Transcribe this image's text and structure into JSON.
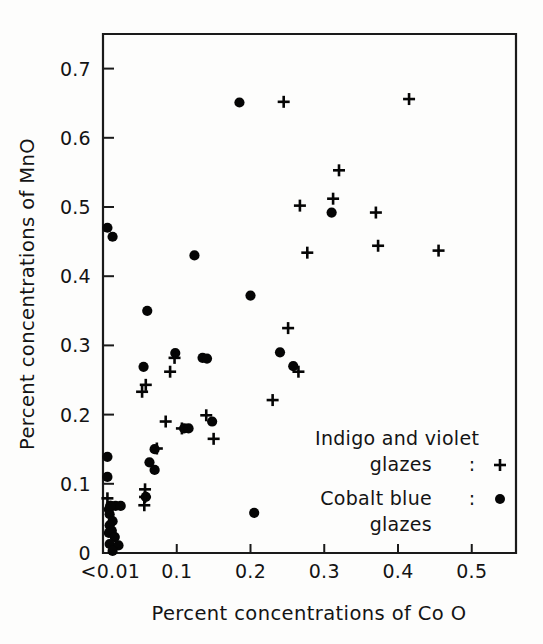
{
  "figure": {
    "background": "#fdfdfc",
    "ink_color": "#141414"
  },
  "axes": {
    "x_title": "Percent concentrations of Co O",
    "y_title": "Percent concentrations of MnO",
    "x_ticks": [
      "<0.01",
      "0.1",
      "0.2",
      "0.3",
      "0.4",
      "0.5"
    ],
    "x_tick_values": [
      0.01,
      0.1,
      0.2,
      0.3,
      0.4,
      0.5
    ],
    "y_ticks": [
      "0",
      "0.1",
      "0.2",
      "0.3",
      "0.4",
      "0.5",
      "0.6",
      "0.7"
    ],
    "y_tick_values": [
      0,
      0.1,
      0.2,
      0.3,
      0.4,
      0.5,
      0.6,
      0.7
    ]
  },
  "legend": {
    "entries": [
      {
        "line1": "Indigo and violet",
        "line2": "glazes",
        "separator": ":",
        "marker": "plus",
        "marker_glyph": "+"
      },
      {
        "line1": "Cobalt blue",
        "line2": "glazes",
        "separator": ":",
        "marker": "dot",
        "marker_glyph": "•"
      }
    ]
  },
  "chart_data": {
    "type": "scatter",
    "title": "",
    "xlabel": "Percent concentrations of Co O",
    "ylabel": "Percent concentrations of MnO",
    "xlim": [
      0.0,
      0.56
    ],
    "ylim": [
      0.0,
      0.75
    ],
    "xticks": [
      0.01,
      0.1,
      0.2,
      0.3,
      0.4,
      0.5
    ],
    "xticklabels": [
      "<0.01",
      "0.1",
      "0.2",
      "0.3",
      "0.4",
      "0.5"
    ],
    "yticks": [
      0,
      0.1,
      0.2,
      0.3,
      0.4,
      0.5,
      0.6,
      0.7
    ],
    "yticklabels": [
      "0",
      "0.1",
      "0.2",
      "0.3",
      "0.4",
      "0.5",
      "0.6",
      "0.7"
    ],
    "grid": false,
    "legend_position": "lower-right",
    "series": [
      {
        "name": "Cobalt blue glazes",
        "marker": "dot",
        "color": "#050505",
        "points": [
          [
            0.006,
            0.47
          ],
          [
            0.013,
            0.457
          ],
          [
            0.185,
            0.651
          ],
          [
            0.31,
            0.492
          ],
          [
            0.124,
            0.43
          ],
          [
            0.2,
            0.372
          ],
          [
            0.06,
            0.35
          ],
          [
            0.24,
            0.29
          ],
          [
            0.098,
            0.289
          ],
          [
            0.135,
            0.282
          ],
          [
            0.141,
            0.281
          ],
          [
            0.055,
            0.269
          ],
          [
            0.258,
            0.27
          ],
          [
            0.148,
            0.19
          ],
          [
            0.11,
            0.18
          ],
          [
            0.116,
            0.18
          ],
          [
            0.07,
            0.15
          ],
          [
            0.006,
            0.139
          ],
          [
            0.063,
            0.131
          ],
          [
            0.07,
            0.12
          ],
          [
            0.006,
            0.11
          ],
          [
            0.058,
            0.081
          ],
          [
            0.01,
            0.068
          ],
          [
            0.017,
            0.068
          ],
          [
            0.024,
            0.068
          ],
          [
            0.008,
            0.063
          ],
          [
            0.009,
            0.056
          ],
          [
            0.205,
            0.058
          ],
          [
            0.013,
            0.046
          ],
          [
            0.009,
            0.04
          ],
          [
            0.012,
            0.032
          ],
          [
            0.008,
            0.029
          ],
          [
            0.016,
            0.023
          ],
          [
            0.009,
            0.013
          ],
          [
            0.021,
            0.011
          ],
          [
            0.013,
            0.003
          ],
          [
            0.01,
            0.068
          ]
        ]
      },
      {
        "name": "Indigo and violet glazes",
        "marker": "plus",
        "color": "#050505",
        "points": [
          [
            0.245,
            0.652
          ],
          [
            0.415,
            0.656
          ],
          [
            0.32,
            0.553
          ],
          [
            0.312,
            0.512
          ],
          [
            0.267,
            0.502
          ],
          [
            0.37,
            0.492
          ],
          [
            0.373,
            0.444
          ],
          [
            0.455,
            0.437
          ],
          [
            0.277,
            0.434
          ],
          [
            0.251,
            0.325
          ],
          [
            0.097,
            0.282
          ],
          [
            0.091,
            0.262
          ],
          [
            0.265,
            0.262
          ],
          [
            0.058,
            0.243
          ],
          [
            0.053,
            0.233
          ],
          [
            0.23,
            0.221
          ],
          [
            0.14,
            0.199
          ],
          [
            0.085,
            0.19
          ],
          [
            0.107,
            0.18
          ],
          [
            0.15,
            0.165
          ],
          [
            0.073,
            0.151
          ],
          [
            0.057,
            0.092
          ],
          [
            0.057,
            0.081
          ],
          [
            0.056,
            0.069
          ],
          [
            0.006,
            0.079
          ]
        ]
      }
    ]
  }
}
